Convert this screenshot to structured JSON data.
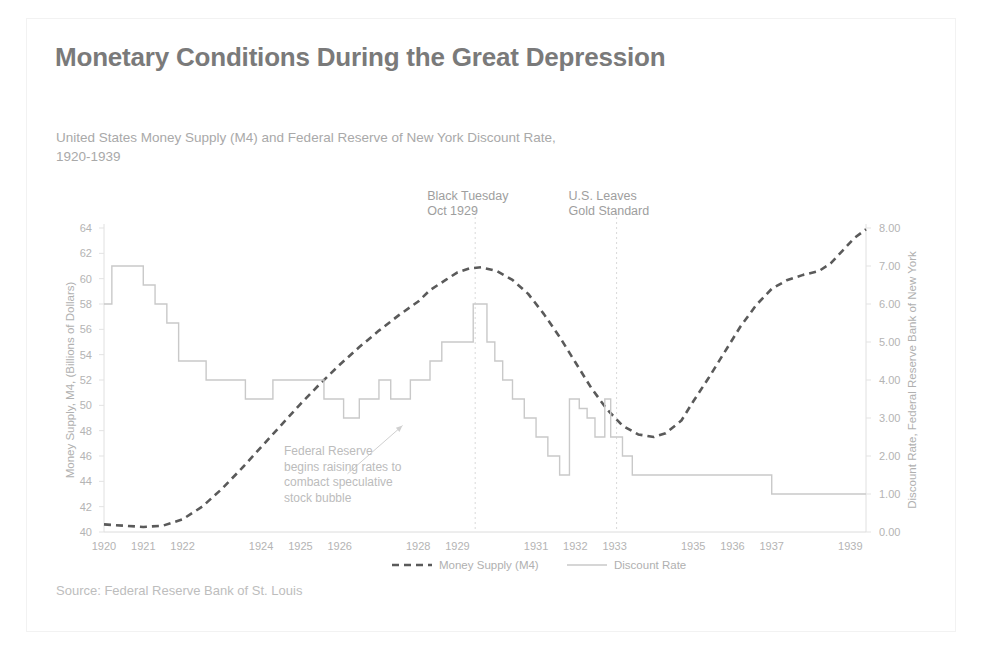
{
  "header": {
    "title": "Monetary Conditions During the Great Depression",
    "subtitle_line1": "United States Money Supply (M4) and Federal Reserve of New York Discount Rate,",
    "subtitle_line2": "1920-1939",
    "source": "Source: Federal Reserve Bank of St. Louis"
  },
  "colors": {
    "money_supply_line": "#5a5a5a",
    "discount_rate_line": "#c9c9c9",
    "title_text": "#7a7a7a",
    "axis_text": "#b4b4b4",
    "gridline": "#d9d9d9",
    "background": "#ffffff"
  },
  "chart_data": {
    "type": "line",
    "title": "Monetary Conditions During the Great Depression",
    "subtitle": "United States Money Supply (M4) and Federal Reserve of New York Discount Rate, 1920-1939",
    "xlabel": "",
    "ylabel": "Money Supply, M4, (Billions of Dollars)",
    "y2label": "Discount Rate, Federal Reserve Bank of New York",
    "xlim": [
      1920,
      1939.4
    ],
    "ylim": [
      40,
      64
    ],
    "y2lim": [
      0.0,
      8.0
    ],
    "yticks": [
      40,
      42,
      44,
      46,
      48,
      50,
      52,
      54,
      56,
      58,
      60,
      62,
      64
    ],
    "y2ticks": [
      "0.00",
      "1.00",
      "2.00",
      "3.00",
      "4.00",
      "5.00",
      "6.00",
      "7.00",
      "8.00"
    ],
    "y2tick_values": [
      0,
      1,
      2,
      3,
      4,
      5,
      6,
      7,
      8
    ],
    "xticks": [
      1920,
      1921,
      1922,
      1924,
      1925,
      1926,
      1928,
      1929,
      1931,
      1932,
      1933,
      1935,
      1936,
      1937,
      1939
    ],
    "xtick_labels": [
      "1920",
      "1921",
      "1922",
      "1924",
      "1925",
      "1926",
      "1928",
      "1929",
      "1931",
      "1932",
      "1933",
      "1935",
      "1936",
      "1937",
      "1939"
    ],
    "grid": false,
    "legend_position": "bottom",
    "series": [
      {
        "name": "Money Supply (M4)",
        "axis": "left",
        "style": "dashed",
        "color": "#5a5a5a",
        "points": [
          [
            1920.0,
            40.6
          ],
          [
            1920.5,
            40.5
          ],
          [
            1921.0,
            40.4
          ],
          [
            1921.5,
            40.5
          ],
          [
            1922.0,
            41.0
          ],
          [
            1922.5,
            42.0
          ],
          [
            1923.0,
            43.4
          ],
          [
            1923.5,
            45.0
          ],
          [
            1924.0,
            46.7
          ],
          [
            1924.5,
            48.4
          ],
          [
            1925.0,
            50.1
          ],
          [
            1925.5,
            51.7
          ],
          [
            1926.0,
            53.2
          ],
          [
            1926.5,
            54.6
          ],
          [
            1927.0,
            55.9
          ],
          [
            1927.5,
            57.1
          ],
          [
            1928.0,
            58.2
          ],
          [
            1928.3,
            59.1
          ],
          [
            1928.7,
            59.9
          ],
          [
            1929.0,
            60.5
          ],
          [
            1929.3,
            60.8
          ],
          [
            1929.6,
            60.9
          ],
          [
            1930.0,
            60.6
          ],
          [
            1930.4,
            59.9
          ],
          [
            1930.8,
            58.8
          ],
          [
            1931.2,
            57.2
          ],
          [
            1931.6,
            55.4
          ],
          [
            1932.0,
            53.4
          ],
          [
            1932.4,
            51.4
          ],
          [
            1932.8,
            49.7
          ],
          [
            1933.2,
            48.4
          ],
          [
            1933.6,
            47.7
          ],
          [
            1934.0,
            47.5
          ],
          [
            1934.3,
            47.8
          ],
          [
            1934.7,
            48.8
          ],
          [
            1935.0,
            50.3
          ],
          [
            1935.4,
            52.2
          ],
          [
            1935.8,
            54.2
          ],
          [
            1936.2,
            56.2
          ],
          [
            1936.6,
            57.9
          ],
          [
            1937.0,
            59.2
          ],
          [
            1937.4,
            59.9
          ],
          [
            1937.8,
            60.3
          ],
          [
            1938.2,
            60.6
          ],
          [
            1938.5,
            61.2
          ],
          [
            1938.8,
            62.2
          ],
          [
            1939.1,
            63.2
          ],
          [
            1939.4,
            63.9
          ]
        ]
      },
      {
        "name": "Discount Rate",
        "axis": "right",
        "style": "solid",
        "color": "#c9c9c9",
        "step": true,
        "points": [
          [
            1920.0,
            6.0
          ],
          [
            1920.2,
            6.0
          ],
          [
            1920.2,
            7.0
          ],
          [
            1921.0,
            7.0
          ],
          [
            1921.0,
            6.5
          ],
          [
            1921.3,
            6.5
          ],
          [
            1921.3,
            6.0
          ],
          [
            1921.6,
            6.0
          ],
          [
            1921.6,
            5.5
          ],
          [
            1921.9,
            5.5
          ],
          [
            1921.9,
            4.5
          ],
          [
            1922.6,
            4.5
          ],
          [
            1922.6,
            4.0
          ],
          [
            1923.6,
            4.0
          ],
          [
            1923.6,
            3.5
          ],
          [
            1924.3,
            3.5
          ],
          [
            1924.3,
            4.0
          ],
          [
            1925.6,
            4.0
          ],
          [
            1925.6,
            3.5
          ],
          [
            1926.1,
            3.5
          ],
          [
            1926.1,
            3.0
          ],
          [
            1926.5,
            3.0
          ],
          [
            1926.5,
            3.5
          ],
          [
            1927.0,
            3.5
          ],
          [
            1927.0,
            4.0
          ],
          [
            1927.3,
            4.0
          ],
          [
            1927.3,
            3.5
          ],
          [
            1927.8,
            3.5
          ],
          [
            1927.8,
            4.0
          ],
          [
            1928.3,
            4.0
          ],
          [
            1928.3,
            4.5
          ],
          [
            1928.6,
            4.5
          ],
          [
            1928.6,
            5.0
          ],
          [
            1929.4,
            5.0
          ],
          [
            1929.4,
            6.0
          ],
          [
            1929.75,
            6.0
          ],
          [
            1929.75,
            5.0
          ],
          [
            1929.95,
            5.0
          ],
          [
            1929.95,
            4.5
          ],
          [
            1930.15,
            4.5
          ],
          [
            1930.15,
            4.0
          ],
          [
            1930.4,
            4.0
          ],
          [
            1930.4,
            3.5
          ],
          [
            1930.7,
            3.5
          ],
          [
            1930.7,
            3.0
          ],
          [
            1931.0,
            3.0
          ],
          [
            1931.0,
            2.5
          ],
          [
            1931.3,
            2.5
          ],
          [
            1931.3,
            2.0
          ],
          [
            1931.6,
            2.0
          ],
          [
            1931.6,
            1.5
          ],
          [
            1931.85,
            1.5
          ],
          [
            1931.85,
            3.5
          ],
          [
            1932.1,
            3.5
          ],
          [
            1932.1,
            3.25
          ],
          [
            1932.3,
            3.25
          ],
          [
            1932.3,
            3.0
          ],
          [
            1932.5,
            3.0
          ],
          [
            1932.5,
            2.5
          ],
          [
            1932.55,
            2.5
          ],
          [
            1932.55,
            2.5
          ],
          [
            1932.75,
            2.5
          ],
          [
            1932.75,
            3.5
          ],
          [
            1932.9,
            3.5
          ],
          [
            1932.9,
            2.5
          ],
          [
            1933.2,
            2.5
          ],
          [
            1933.2,
            2.0
          ],
          [
            1933.45,
            2.0
          ],
          [
            1933.45,
            1.5
          ],
          [
            1937.0,
            1.5
          ],
          [
            1937.0,
            1.0
          ],
          [
            1939.4,
            1.0
          ]
        ]
      }
    ],
    "event_markers": [
      {
        "id": "black-tuesday",
        "x": 1929.45,
        "label_line1": "Black Tuesday",
        "label_line2": "Oct 1929"
      },
      {
        "id": "gold-standard",
        "x": 1933.05,
        "label_line1": "U.S. Leaves",
        "label_line2": "Gold Standard"
      }
    ],
    "annotations": [
      {
        "id": "fed-raises-rates",
        "lines": [
          "Federal Reserve",
          "begins raising rates to",
          "combact speculative",
          "stock bubble"
        ],
        "arrow_from_x": 1926.2,
        "arrow_from_y": 44.6,
        "arrow_to_x": 1927.6,
        "arrow_to_y": 48.4
      }
    ],
    "legend": [
      {
        "name": "Money Supply (M4)",
        "style": "dashed",
        "color": "#5a5a5a"
      },
      {
        "name": "Discount Rate",
        "style": "solid",
        "color": "#c9c9c9"
      }
    ]
  }
}
